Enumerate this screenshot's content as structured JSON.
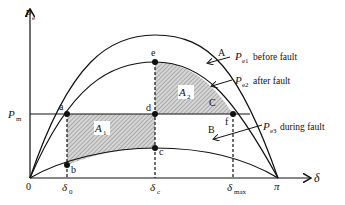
{
  "diagram": {
    "type": "power-angle curve (equal area criterion)",
    "axes": {
      "y_label": "P",
      "y_label_sub": "e",
      "x_label": "δ",
      "origin_label": "0",
      "pi_label": "π",
      "pm_label": "P",
      "pm_label_sub": "m"
    },
    "x_ticks": {
      "delta0": {
        "main": "δ",
        "sub": "0"
      },
      "deltac": {
        "main": "δ",
        "sub": "c"
      },
      "deltamax": {
        "main": "δ",
        "sub": "max"
      }
    },
    "curves": [
      {
        "id": "A",
        "letter": "A",
        "name": "P",
        "sub": "e1",
        "desc": "before fault"
      },
      {
        "id": "C",
        "letter": "C",
        "name": "P",
        "sub": "e2",
        "desc": "after fault"
      },
      {
        "id": "B",
        "letter": "B",
        "name": "P",
        "sub": "e3",
        "desc": "during fault"
      }
    ],
    "points": [
      "a",
      "b",
      "c",
      "d",
      "e",
      "f"
    ],
    "areas": [
      {
        "main": "A",
        "sub": "1",
        "desc": "acceleration area"
      },
      {
        "main": "A",
        "sub": "2",
        "desc": "deceleration area"
      }
    ],
    "colors": {
      "line": "#111111",
      "hatch": "#9a9a9a",
      "background": "#ffffff"
    }
  }
}
